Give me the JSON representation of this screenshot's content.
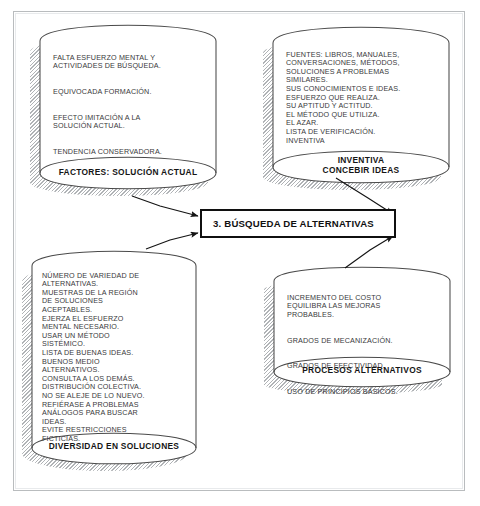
{
  "diagram": {
    "type": "flow-diagram",
    "center": {
      "label": "3.  BÚSQUEDA DE ALTERNATIVAS"
    },
    "nodes": [
      {
        "id": "factores",
        "shape": "cylinder",
        "position": "top-left",
        "label": "FACTORES: SOLUCIÓN ACTUAL",
        "blocks": [
          "FALTA ESFUERZO MENTAL Y\nACTIVIDADES DE BÚSQUEDA.",
          "EQUIVOCADA FORMACIÓN.",
          "EFECTO IMITACIÓN A LA\nSOLUCIÓN ACTUAL.",
          "TENDENCIA CONSERVADORA."
        ]
      },
      {
        "id": "inventiva",
        "shape": "cylinder",
        "position": "top-right",
        "label": "INVENTIVA\nCONCEBIR  IDEAS",
        "blocks": [
          "FUENTES: LIBROS, MANUALES,\nCONVERSACIONES, MÉTODOS,\nSOLUCIONES A PROBLEMAS\nSIMILARES.\nSUS CONOCIMIENTOS E IDEAS.\nESFUERZO QUE REALIZA.\nSU APTITUD Y ACTITUD.\nEL MÉTODO QUE UTILIZA.\nEL AZAR.\nLISTA DE VERIFICACIÓN.\nINVENTIVA"
        ]
      },
      {
        "id": "diversidad",
        "shape": "cylinder",
        "position": "bottom-left",
        "label": "DIVERSIDAD EN SOLUCIONES",
        "blocks": [
          "NÚMERO DE VARIEDAD DE\nALTERNATIVAS.\nMUESTRAS DE LA REGIÓN\nDE SOLUCIONES\nACEPTABLES.\nEJERZA EL ESFUERZO\nMENTAL NECESARIO.\nUSAR UN MÉTODO\nSISTÉMICO.\nLISTA DE BUENAS IDEAS.\nBUENOS MEDIO\nALTERNATIVOS.\nCONSULTA A LOS DEMÁS.\nDISTRIBUCIÓN COLECTIVA.\nNO SE ALEJE DE LO NUEVO.\nREFIÉRASE A PROBLEMAS\nANÁLOGOS PARA BUSCAR\nIDEAS.\nEVITE RESTRICCIONES\nFICTICIAS."
        ]
      },
      {
        "id": "procesos",
        "shape": "cylinder",
        "position": "bottom-right",
        "label": "PROCESOS ALTERNATIVOS",
        "blocks": [
          "INCREMENTO DEL COSTO\nEQUILIBRA LAS MEJORAS\nPROBABLES.",
          "GRADOS DE MECANIZACIÓN.",
          "GRADOS DE EFECTIVIDAD.",
          "USO DE PRINCIPIOS BÁSICOS."
        ]
      }
    ],
    "edges": [
      {
        "from": "factores",
        "to": "center",
        "direction": "into-left-top"
      },
      {
        "from": "diversidad",
        "to": "center",
        "direction": "into-left-bottom"
      },
      {
        "from": "inventiva",
        "to": "center",
        "direction": "into-right-top"
      },
      {
        "from": "procesos",
        "to": "center",
        "direction": "into-right-bottom"
      }
    ],
    "colors": {
      "line": "#2b2b2b",
      "frame": "#b9bcbe",
      "box_border": "#101010",
      "text": "#39393b",
      "background": "#ffffff"
    }
  }
}
